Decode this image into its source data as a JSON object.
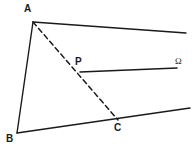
{
  "figure": {
    "type": "geometry-diagram",
    "width": 196,
    "height": 154,
    "background_color": "#ffffff",
    "stroke_color": "#1a1a1a",
    "labels": {
      "a": "A",
      "b": "B",
      "c": "C",
      "p": "P",
      "omega": "Ω"
    },
    "points": {
      "A": {
        "x": 33,
        "y": 22
      },
      "B": {
        "x": 17,
        "y": 133
      },
      "C": {
        "x": 118,
        "y": 120
      },
      "P": {
        "x": 80,
        "y": 72
      },
      "ray_a_end": {
        "x": 186,
        "y": 33
      },
      "ray_b_end": {
        "x": 190,
        "y": 108
      },
      "ray_p_end": {
        "x": 177,
        "y": 68
      }
    },
    "segments": [
      {
        "name": "segment-AB",
        "from": "A",
        "to": "B",
        "style": "solid"
      },
      {
        "name": "ray-A-right",
        "from": "A",
        "to": "ray_a_end",
        "style": "solid"
      },
      {
        "name": "ray-B-right",
        "from": "B",
        "to": "ray_b_end",
        "style": "solid"
      },
      {
        "name": "ray-P-omega",
        "from": "P",
        "to": "ray_p_end",
        "style": "solid"
      },
      {
        "name": "dashed-AC",
        "from": "A",
        "to": "C",
        "style": "dashed"
      }
    ]
  }
}
